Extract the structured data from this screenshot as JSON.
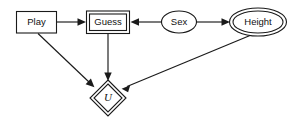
{
  "diagram": {
    "type": "influence-diagram",
    "background_color": "#ffffff",
    "stroke_color": "#1a1a1a",
    "fill_color": "#ffffff",
    "nodes": [
      {
        "id": "play",
        "label": "Play",
        "shape": "rectangle",
        "border": "single",
        "role": "decision",
        "cx": 36,
        "cy": 22
      },
      {
        "id": "guess",
        "label": "Guess",
        "shape": "rectangle",
        "border": "double",
        "role": "decision",
        "cx": 108,
        "cy": 22
      },
      {
        "id": "sex",
        "label": "Sex",
        "shape": "ellipse",
        "border": "single",
        "role": "chance",
        "cx": 179,
        "cy": 22
      },
      {
        "id": "height",
        "label": "Height",
        "shape": "ellipse",
        "border": "double",
        "role": "chance",
        "cx": 258,
        "cy": 22
      },
      {
        "id": "u",
        "label": "U",
        "shape": "diamond",
        "border": "double",
        "role": "utility",
        "cx": 108,
        "cy": 98
      }
    ],
    "edges": [
      {
        "id": "play-to-guess",
        "from": "Play",
        "to": "Guess",
        "arrow": "end"
      },
      {
        "id": "sex-to-guess",
        "from": "Sex",
        "to": "Guess",
        "arrow": "end"
      },
      {
        "id": "sex-to-height",
        "from": "Sex",
        "to": "Height",
        "arrow": "end"
      },
      {
        "id": "play-to-u",
        "from": "Play",
        "to": "U",
        "arrow": "end"
      },
      {
        "id": "guess-to-u",
        "from": "Guess",
        "to": "U",
        "arrow": "end"
      },
      {
        "id": "height-to-u",
        "from": "Height",
        "to": "U",
        "arrow": "end"
      }
    ]
  }
}
